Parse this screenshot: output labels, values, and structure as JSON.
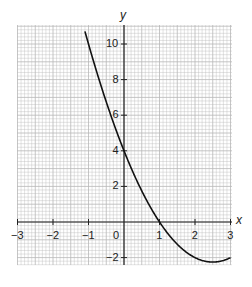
{
  "chart_data": {
    "type": "line",
    "title": "",
    "xlabel": "x",
    "ylabel": "y",
    "xlim": [
      -3,
      3
    ],
    "ylim": [
      -2.5,
      11.5
    ],
    "grid": true,
    "x_ticks": [
      -3,
      -2,
      -1,
      0,
      1,
      2,
      3
    ],
    "x_tick_labels": [
      "−3",
      "−2",
      "−1",
      "0",
      "1",
      "2",
      "3"
    ],
    "y_ticks": [
      -2,
      2,
      4,
      6,
      8,
      10
    ],
    "y_tick_labels": [
      "−2",
      "2",
      "4",
      "6",
      "8",
      "10"
    ],
    "series": [
      {
        "name": "y = x² − 5x + 4",
        "x": [
          -1.1,
          -1,
          -0.5,
          0,
          0.5,
          1,
          1.5,
          2,
          2.5,
          3
        ],
        "values": [
          10.71,
          10,
          6.75,
          4,
          1.75,
          0,
          -1.25,
          -2,
          -2.25,
          -2
        ]
      }
    ],
    "colors": {
      "grid": "#b8b8b8",
      "axis": "#222222",
      "curve": "#111111"
    }
  }
}
